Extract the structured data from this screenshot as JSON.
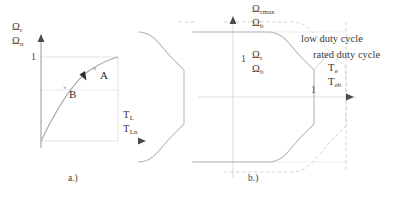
{
  "figure_a": {
    "caption": "a.)",
    "y_axis": {
      "symbol_top": "Ω",
      "symbol_top_sub": "r",
      "symbol_bottom": "Ω",
      "symbol_bottom_sub": "n",
      "tick_label": "1"
    },
    "x_axis": {
      "symbol_top": "T",
      "symbol_top_sub": "L",
      "symbol_bottom": "T",
      "symbol_bottom_sub": "Ln"
    },
    "points": [
      {
        "label": "A",
        "marker": "×"
      },
      {
        "label": "B",
        "marker": "×"
      }
    ],
    "curve_description": "concave speed-torque curve from origin to corner"
  },
  "figure_b": {
    "caption": "b.)",
    "y_axis": {
      "symbol_top": "Ω",
      "symbol_top_sub": "rmax",
      "symbol_bottom": "Ω",
      "symbol_bottom_sub": "b"
    },
    "inner_label": {
      "tick": "1",
      "symbol_top": "Ω",
      "symbol_top_sub": "r",
      "symbol_bottom": "Ω",
      "symbol_bottom_sub": "b"
    },
    "right_tick": "1",
    "x_axis": {
      "symbol_top": "T",
      "symbol_top_sub": "e",
      "symbol_bottom": "T",
      "symbol_bottom_sub": "eb"
    },
    "annotations": [
      {
        "text": "low duty cycle"
      },
      {
        "text": "rated duty cycle"
      }
    ]
  },
  "colors": {
    "axis": "#6b6b6b",
    "curve": "#9a9a9a",
    "grid": "#d8d8d8",
    "dashed": "#c8c8c8",
    "text": "#3a3a3a"
  }
}
